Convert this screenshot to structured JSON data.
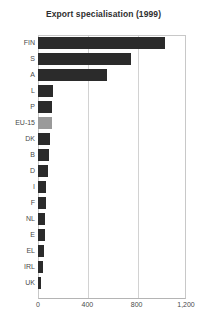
{
  "chart_data": {
    "type": "bar",
    "orientation": "horizontal",
    "title": "Export specialisation (1999)",
    "xlabel": "",
    "ylabel": "",
    "xlim": [
      0,
      1200
    ],
    "xticks": [
      0,
      400,
      800,
      1200
    ],
    "xticklabels": [
      "0",
      "400",
      "800",
      "1,200"
    ],
    "grid": true,
    "grid_axis": "x",
    "legend": null,
    "categories": [
      "FIN",
      "S",
      "A",
      "L",
      "P",
      "EU-15",
      "DK",
      "B",
      "D",
      "I",
      "F",
      "NL",
      "E",
      "EL",
      "IRL",
      "UK"
    ],
    "values": [
      1030,
      754,
      560,
      122,
      113,
      110,
      98,
      90,
      82,
      68,
      66,
      58,
      55,
      50,
      42,
      26
    ],
    "bar_color": "#2b2b2b",
    "highlight_color": "#9a9a9a",
    "highlight_category": "EU-15"
  },
  "axis": {
    "tick_labels": [
      "0",
      "400",
      "800",
      "1,200"
    ]
  }
}
